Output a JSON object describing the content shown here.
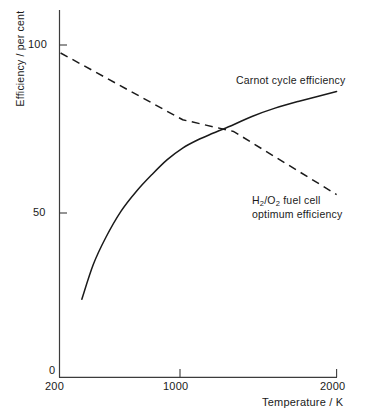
{
  "chart_data": {
    "type": "line",
    "title": "",
    "xlabel": "Temperature / K",
    "ylabel": "Efficiency / per cent",
    "xlim": [
      200,
      2000
    ],
    "ylim": [
      0,
      105
    ],
    "xticks": [
      "200",
      "1000",
      "2000"
    ],
    "yticks": [
      "0",
      "50",
      "100"
    ],
    "grid": false,
    "legend_position": "inline-annotations",
    "series": [
      {
        "name": "Carnot cycle efficiency",
        "style": "solid",
        "color": "#1a1a1a",
        "x": [
          345,
          420,
          500,
          600,
          700,
          800,
          900,
          1000,
          1100,
          1200,
          1330,
          1450,
          1600,
          1750,
          2000
        ],
        "values": [
          23.5,
          34,
          42,
          50,
          56,
          61,
          65.5,
          69,
          71.5,
          73.5,
          76,
          78.5,
          81,
          83,
          86
        ]
      },
      {
        "name": "H2/O2 fuel cell optimum efficiency",
        "style": "dashed",
        "color": "#1a1a1a",
        "x": [
          207,
          1000,
          1330,
          2000
        ],
        "values": [
          97.6,
          77.5,
          74,
          55
        ]
      }
    ],
    "annotations": [
      {
        "id": "carnot",
        "text": "Carnot cycle efficiency",
        "at_x": 1600,
        "at_y": 89
      },
      {
        "id": "fuelcell",
        "line1": "H",
        "line1_sub1": "2",
        "line1_mid": "/O",
        "line1_sub2": "2",
        "line1_end": " fuel cell",
        "line2": "optimum efficiency",
        "at_x": 1650,
        "at_y": 56
      }
    ],
    "crossing_point": {
      "x": 1330,
      "y": 74
    }
  },
  "axes": {
    "y_label": "Efficiency / per cent",
    "x_label": "Temperature / K",
    "y_tick_100": "100",
    "y_tick_50": "50",
    "y_tick_0": "0",
    "x_tick_200": "200",
    "x_tick_1000": "1000",
    "x_tick_2000": "2000",
    "axis_color": "#3c3c3c"
  },
  "annotations": {
    "carnot": "Carnot cycle efficiency",
    "fuelcell_h": "H",
    "fuelcell_sub_a": "2",
    "fuelcell_slash_o": "/O",
    "fuelcell_sub_b": "2",
    "fuelcell_rest": " fuel cell",
    "fuelcell_line2": "optimum efficiency"
  }
}
